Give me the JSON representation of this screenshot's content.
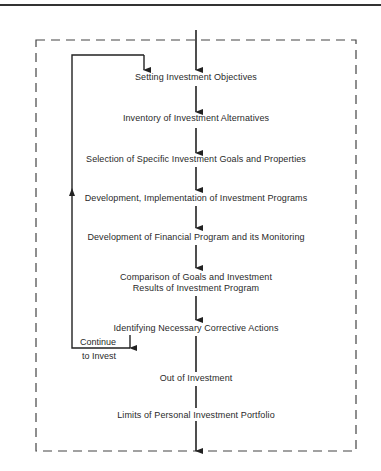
{
  "diagram": {
    "type": "flowchart",
    "steps": [
      {
        "label": "Setting Investment Objectives"
      },
      {
        "label": "Inventory of Investment Alternatives"
      },
      {
        "label": "Selection of Specific Investment Goals and Properties"
      },
      {
        "label": "Development, Implementation of Investment Programs"
      },
      {
        "label": "Development of Financial Program and its Monitoring"
      },
      {
        "label": "Comparison of Goals and Investment",
        "label2": "Results of Investment Program"
      },
      {
        "label": "Identifying Necessary Corrective Actions"
      },
      {
        "label": "Out of Investment"
      },
      {
        "label": "Limits of Personal Investment Portfolio"
      }
    ],
    "loop": {
      "label1": "Continue",
      "label2": "to Invest"
    }
  }
}
